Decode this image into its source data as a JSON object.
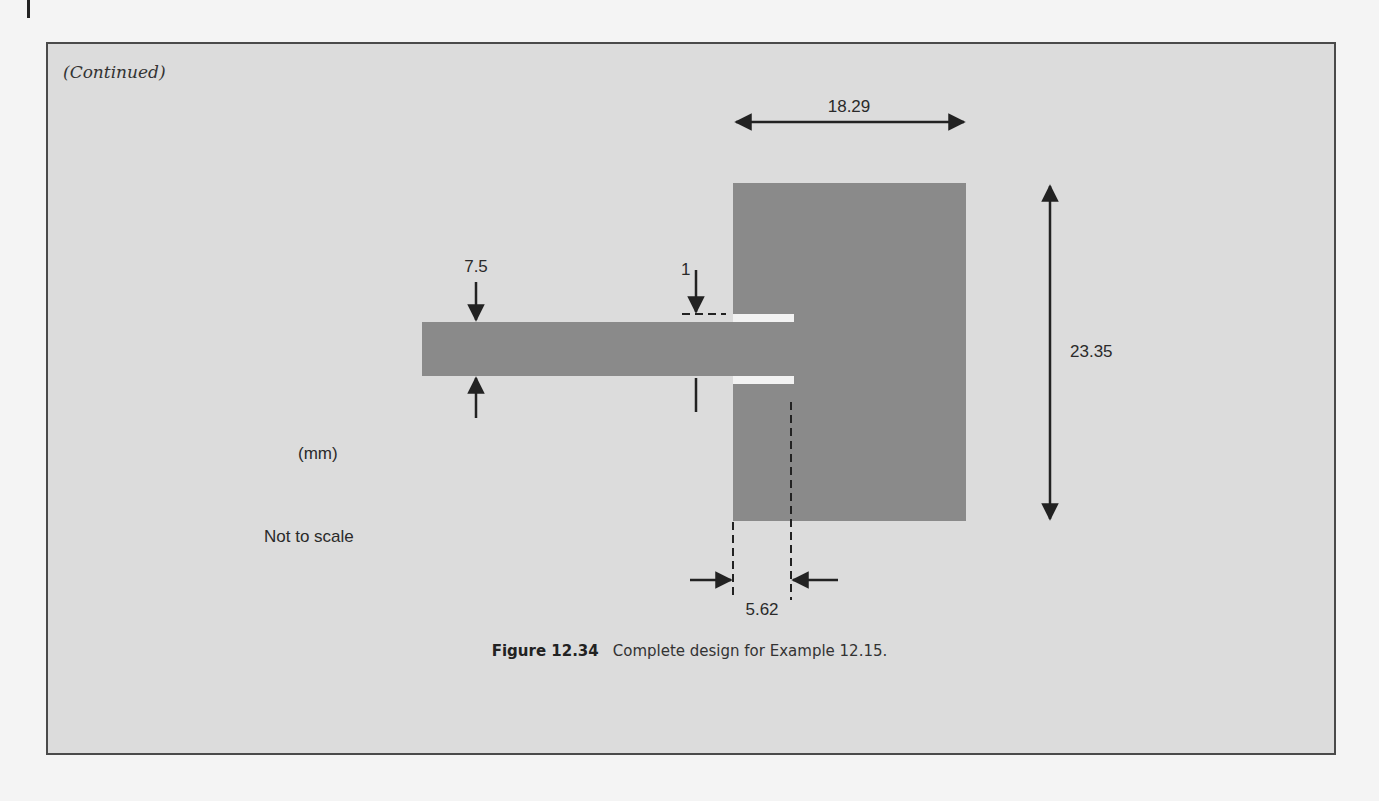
{
  "page": {
    "continued_label": "(Continued)"
  },
  "figure": {
    "number": "Figure 12.34",
    "caption": "Complete design for Example 12.15.",
    "units_label": "(mm)",
    "scale_note": "Not to scale",
    "dimensions": {
      "patch_width": "18.29",
      "patch_length": "23.35",
      "feed_width": "7.5",
      "gap_width": "1",
      "inset_depth": "5.62"
    },
    "colors": {
      "background": "#dcdcdc",
      "metal": "#8a8a8a",
      "gap": "#f2f2f2",
      "dimension_line": "#222222"
    }
  }
}
